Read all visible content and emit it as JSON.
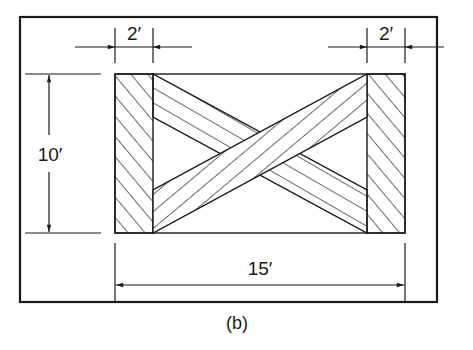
{
  "diagram": {
    "caption": "(b)",
    "dimensions": {
      "left_bar_width": "2′",
      "right_bar_width": "2′",
      "height": "10′",
      "length": "15′"
    },
    "colors": {
      "line": "#1a1a1a",
      "background": "#ffffff"
    }
  }
}
